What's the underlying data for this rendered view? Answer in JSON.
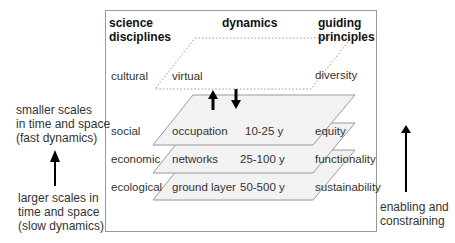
{
  "headers": {
    "disciplines": [
      "science",
      "disciplines"
    ],
    "dynamics": "dynamics",
    "principles": [
      "guiding",
      "principles"
    ]
  },
  "layers": [
    {
      "discipline": "cultural",
      "name": "virtual",
      "period": "",
      "principle": "diversity",
      "style": "dotted"
    },
    {
      "discipline": "social",
      "name": "occupation",
      "period": "10-25 y",
      "principle": "equity",
      "style": "solid"
    },
    {
      "discipline": "economic",
      "name": "networks",
      "period": "25-100 y",
      "principle": "functionality",
      "style": "solid"
    },
    {
      "discipline": "ecological",
      "name": "ground layer",
      "period": "50-500 y",
      "principle": "sustainability",
      "style": "solid"
    }
  ],
  "left_axis": {
    "top": [
      "smaller scales",
      "in time and space",
      "(fast dynamics)"
    ],
    "bottom": [
      "larger scales in",
      "time and space",
      "(slow dynamics)"
    ]
  },
  "right_axis": {
    "label": [
      "enabling and",
      "constraining"
    ]
  },
  "colors": {
    "layer_fill": "#f2f2f2",
    "layer_stroke": "#9a9a9a",
    "arrow": "#000000"
  }
}
